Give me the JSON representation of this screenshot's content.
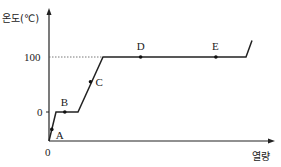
{
  "chart_data": {
    "type": "line",
    "title": "",
    "xlabel": "열량",
    "ylabel": "온도(℃)",
    "y_ticks": [
      "0",
      "100"
    ],
    "x_ticks": [
      "0"
    ],
    "series": [
      {
        "name": "heating-curve",
        "points": [
          {
            "x": 0,
            "y": -50
          },
          {
            "x": 1,
            "y": 0
          },
          {
            "x": 3,
            "y": 0
          },
          {
            "x": 6,
            "y": 100
          },
          {
            "x": 25,
            "y": 100
          },
          {
            "x": 26,
            "y": 130
          }
        ]
      }
    ],
    "markers": [
      {
        "label": "A",
        "x": 0.4,
        "y": -30
      },
      {
        "label": "B",
        "x": 1.8,
        "y": 0
      },
      {
        "label": "C",
        "x": 4.5,
        "y": 55
      },
      {
        "label": "D",
        "x": 11,
        "y": 100
      },
      {
        "label": "E",
        "x": 21,
        "y": 100
      }
    ],
    "reference_line": {
      "y": 100,
      "style": "dotted"
    },
    "xlim": [
      0,
      29
    ],
    "ylim": [
      -50,
      180
    ]
  }
}
